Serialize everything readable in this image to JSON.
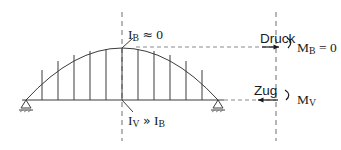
{
  "figure": {
    "type": "structural-engineering-diagram",
    "stroke_color": "#3c3c3c",
    "text_color": "#1a1a1a",
    "background": "#ffffff"
  },
  "labels": {
    "stiffness_top": {
      "symbol": "I",
      "subscript": "B",
      "operator": "≈",
      "value": "0",
      "full": "I_B ≈ 0"
    },
    "stiffness_bottom": {
      "symbol_1": "I",
      "subscript_1": "V",
      "operator": "»",
      "symbol_2": "I",
      "subscript_2": "B",
      "full": "I_V » I_B"
    },
    "force_top": "Druck",
    "force_bottom": "Zug",
    "moment_top": {
      "symbol": "M",
      "subscript": "B",
      "equals": "= 0",
      "full": "M_B = 0"
    },
    "moment_bottom": {
      "symbol": "M",
      "subscript": "V",
      "full": "M_V"
    }
  },
  "geometry": {
    "arch_span_px": 192,
    "arch_rise_px": 52,
    "hanger_count": 11,
    "deck_y_px": 100,
    "crown_x_px": 122,
    "crown_y_px": 48,
    "left_support_x_px": 26,
    "right_support_x_px": 218,
    "centerline_x_px": 122,
    "section_line_x_px": 276
  }
}
